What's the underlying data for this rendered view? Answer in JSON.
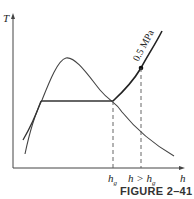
{
  "figure": {
    "caption": "FIGURE 2–41",
    "y_axis_label": "T",
    "x_axis_label": "h",
    "pressure_label": "0.5 MPa",
    "tick_labels": [
      {
        "main": "h",
        "sub": "g"
      },
      {
        "main": "h > h",
        "sub": "g"
      }
    ]
  },
  "colors": {
    "line": "#333333",
    "dash": "#555555"
  }
}
